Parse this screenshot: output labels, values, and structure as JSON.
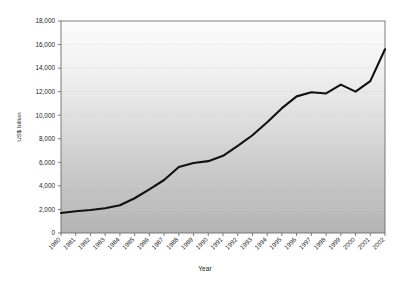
{
  "chart_data": {
    "type": "line",
    "title": "",
    "xlabel": "Year",
    "ylabel": "US$ billion",
    "xlim": [
      1980,
      2002
    ],
    "ylim": [
      0,
      18000
    ],
    "ytick_step": 2000,
    "grid": true,
    "legend": null,
    "line_color": "#111111",
    "background_top_color": "#fbfbfb",
    "background_bottom_color": "#b5b5b5",
    "axis_color": "#6e6e6e",
    "gridline_color": "#d2d2d2",
    "categories": [
      "1980",
      "1981",
      "1982",
      "1983",
      "1984",
      "1985",
      "1986",
      "1987",
      "1988",
      "1989",
      "1990",
      "1991",
      "1992",
      "1993",
      "1994",
      "1995",
      "1996",
      "1997",
      "1998",
      "1999",
      "2000",
      "2001",
      "2002"
    ],
    "ytick_labels": [
      "0",
      "2,000",
      "4,000",
      "6,000",
      "8,000",
      "10,000",
      "12,000",
      "14,000",
      "16,000",
      "18,000"
    ],
    "ytick_values": [
      0,
      2000,
      4000,
      6000,
      8000,
      10000,
      12000,
      14000,
      16000,
      18000
    ],
    "series": [
      {
        "name": "US$ billion",
        "values": [
          1700,
          1850,
          1950,
          2100,
          2350,
          2950,
          3700,
          4500,
          5600,
          5950,
          6100,
          6550,
          7400,
          8300,
          9400,
          10600,
          11600,
          11950,
          11850,
          12600,
          12000,
          12900,
          15600
        ]
      }
    ]
  }
}
